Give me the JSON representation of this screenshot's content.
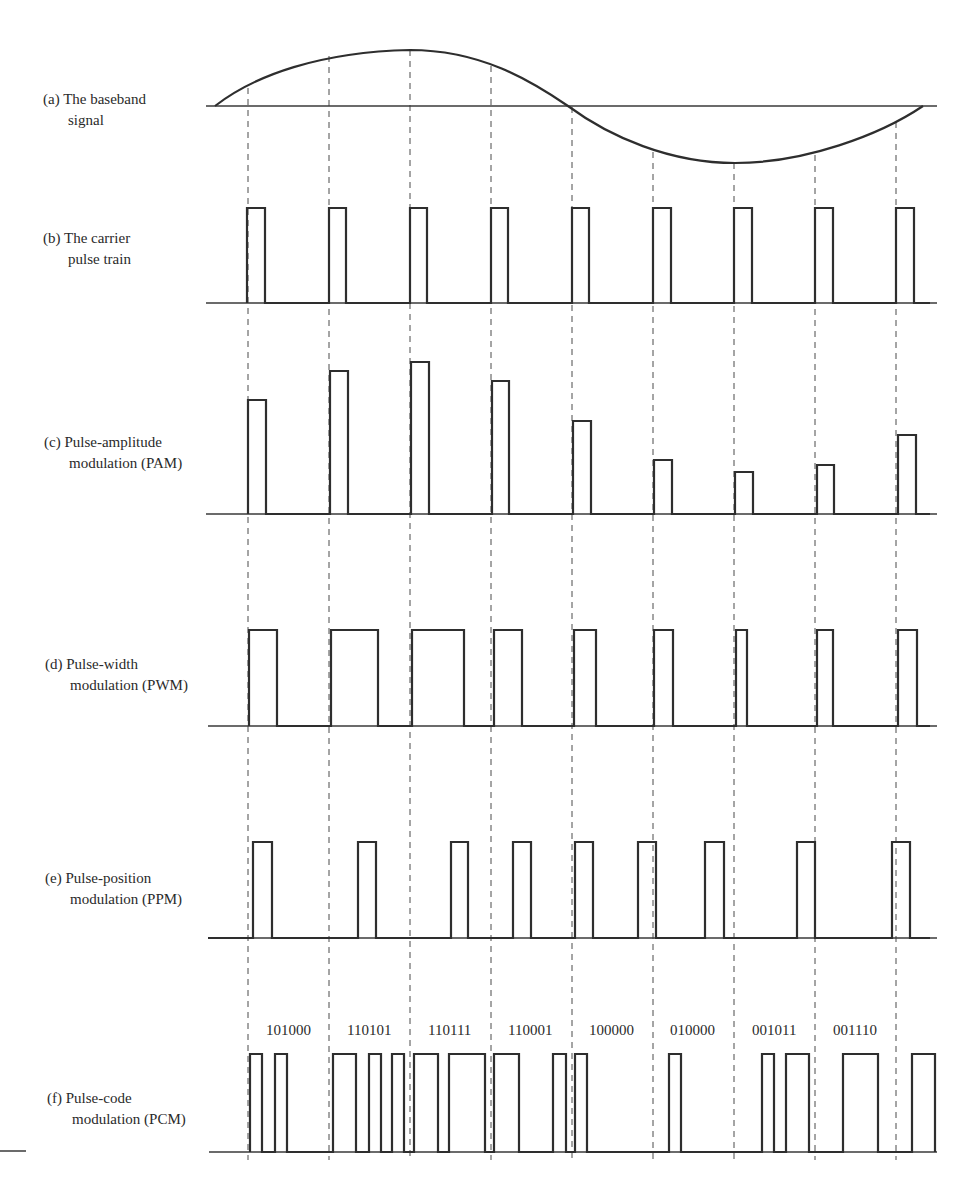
{
  "panels": [
    {
      "id": "a",
      "prefix": "(a)",
      "line1": "The baseband",
      "line2": "signal"
    },
    {
      "id": "b",
      "prefix": "(b)",
      "line1": "The carrier",
      "line2": "pulse train"
    },
    {
      "id": "c",
      "prefix": "(c)",
      "line1": "Pulse-amplitude",
      "line2": "modulation (PAM)"
    },
    {
      "id": "d",
      "prefix": "(d)",
      "line1": "Pulse-width",
      "line2": "modulation (PWM)"
    },
    {
      "id": "e",
      "prefix": "(e)",
      "line1": "Pulse-position",
      "line2": "modulation (PPM)"
    },
    {
      "id": "f",
      "prefix": "(f)",
      "line1": "Pulse-code",
      "line2": "modulation (PCM)"
    }
  ],
  "sample_positions_px": [
    248,
    329,
    410,
    492,
    573,
    654,
    736,
    817,
    898
  ],
  "pcm_codes": [
    "101000",
    "110101",
    "110111",
    "110001",
    "100000",
    "010000",
    "001011",
    "001110"
  ],
  "pam_relative_amplitudes": [
    0.65,
    0.8,
    0.85,
    0.75,
    0.54,
    0.3,
    0.23,
    0.28,
    0.46
  ],
  "pwm_relative_widths": [
    0.33,
    0.58,
    0.64,
    0.36,
    0.35,
    0.28,
    0.22,
    0.2,
    0.3
  ],
  "ppm_pulse_offsets_px": [
    5,
    29,
    40,
    20,
    0,
    30,
    52,
    42,
    12
  ],
  "colors": {
    "ink": "#2e2e2e",
    "background": "#ffffff"
  }
}
